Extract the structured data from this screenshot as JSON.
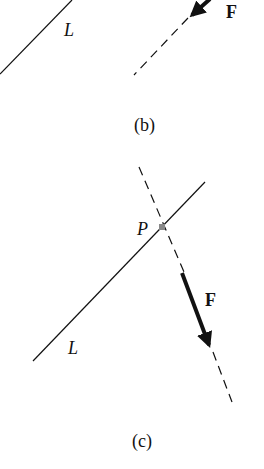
{
  "panel_b": {
    "line_label": "L",
    "force_label": "F",
    "caption": "(b)"
  },
  "panel_c": {
    "point_label": "P",
    "line_label": "L",
    "force_label": "F",
    "caption": "(c)"
  },
  "colors": {
    "ink": "#111111",
    "point": "#888888"
  }
}
